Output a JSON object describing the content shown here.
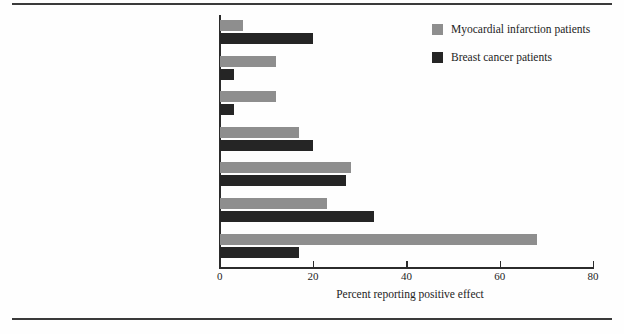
{
  "figure": {
    "background_color": "#fefefe",
    "rule_color": "#3a3a3a"
  },
  "chart_data": {
    "type": "bar",
    "orientation": "horizontal",
    "title": "",
    "subtitle": "",
    "xlabel": "Percent reporting positive effect",
    "ylabel": "",
    "xlim": [
      0,
      80
    ],
    "xticks": [
      0,
      20,
      40,
      60,
      80
    ],
    "xtick_labels": [
      "0",
      "20",
      "40",
      "60",
      "80"
    ],
    "grid": false,
    "legend_position": "upper right",
    "categories": [
      "Improved empathy",
      "Greater knowledge about health",
      "A second chance",
      "A change in personal life priorities",
      "Greater appreciation of health and life",
      "Improved close relationships",
      "Healthy lifestyle change"
    ],
    "series": [
      {
        "name": "Myocardial infarction patients",
        "color": "#8e8e8e",
        "values": [
          5,
          12,
          12,
          17,
          28,
          23,
          68
        ]
      },
      {
        "name": "Breast cancer patients",
        "color": "#252525",
        "values": [
          20,
          3,
          3,
          20,
          27,
          33,
          17
        ]
      }
    ],
    "annotations": []
  },
  "legend": {
    "entries": [
      {
        "label": "Myocardial infarction patients",
        "color": "#8e8e8e"
      },
      {
        "label": "Breast cancer patients",
        "color": "#252525"
      }
    ]
  }
}
